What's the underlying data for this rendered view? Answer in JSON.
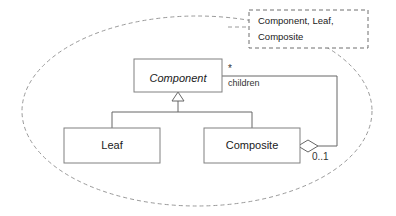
{
  "diagram": {
    "classes": [
      {
        "id": "component",
        "name": "Component",
        "abstract": true
      },
      {
        "id": "leaf",
        "name": "Leaf",
        "abstract": false
      },
      {
        "id": "composite",
        "name": "Composite",
        "abstract": false
      }
    ],
    "association": {
      "role_label": "children",
      "source_multiplicity": "*",
      "target_multiplicity": "0..1",
      "aggregation": "shared"
    },
    "generalization": {
      "parent": "Component",
      "children": [
        "Leaf",
        "Composite"
      ]
    },
    "note": {
      "lines": [
        "Component, Leaf,",
        "Composite"
      ],
      "border_style": "dashed"
    },
    "boundary": {
      "shape": "ellipse",
      "border_style": "dashed"
    },
    "colors": {
      "box_border": "#808080",
      "line": "#666666",
      "dashed": "#9a9a9a",
      "text": "#1a1a1a",
      "background": "#ffffff"
    }
  }
}
